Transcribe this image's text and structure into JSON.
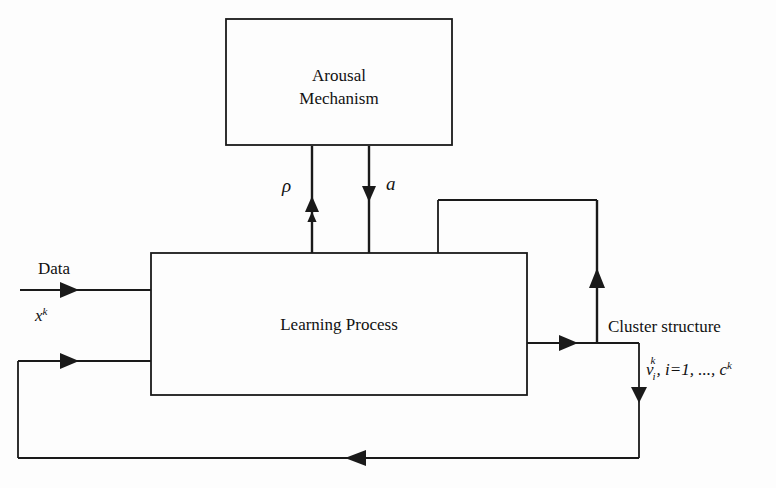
{
  "diagram": {
    "type": "block-flow-diagram",
    "background_color": "#fdfdfd",
    "line_color": "#1a1a1a",
    "boxes": [
      {
        "id": "arousal",
        "line1": "Arousal",
        "line2": "Mechanism",
        "x": 226,
        "y": 19,
        "w": 226,
        "h": 126
      },
      {
        "id": "learning",
        "line1": "Learning Process",
        "line2": "",
        "x": 151,
        "y": 253,
        "w": 376,
        "h": 142
      }
    ],
    "labels": {
      "rho": "ρ",
      "a": "a",
      "data": "Data",
      "data_var_base": "x",
      "data_var_sup": "k",
      "cluster_structure": "Cluster structure",
      "cluster_var_base": "v",
      "cluster_var_sub": "i",
      "cluster_var_sup": "k",
      "cluster_range": ", i=1, ..., c",
      "cluster_range_sup": "k"
    },
    "edges": [
      {
        "id": "rho-up",
        "from": "learning",
        "to": "arousal",
        "label": "ρ",
        "direction": "up"
      },
      {
        "id": "a-down",
        "from": "arousal",
        "to": "learning",
        "label": "a",
        "direction": "down"
      },
      {
        "id": "data-in",
        "from": "external",
        "to": "learning",
        "label": "Data",
        "direction": "right"
      },
      {
        "id": "feedback-in",
        "from": "bottom-loop",
        "to": "learning",
        "label": "",
        "direction": "right"
      },
      {
        "id": "output-right",
        "from": "learning",
        "to": "cluster",
        "label": "Cluster structure",
        "direction": "right"
      },
      {
        "id": "top-feedback",
        "from": "cluster",
        "to": "learning",
        "label": "",
        "direction": "up-left-down"
      },
      {
        "id": "bottom-feedback",
        "from": "cluster",
        "to": "learning",
        "label": "",
        "direction": "down-left-up"
      }
    ]
  }
}
